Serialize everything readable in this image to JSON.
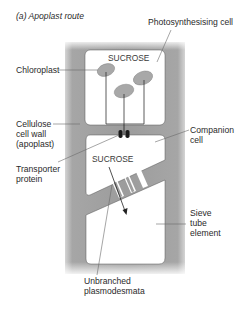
{
  "figure": {
    "title": "(a) Apoplast route",
    "colors": {
      "cell_wall": "#9a9a9a",
      "cell_wall_edge": "#c8c8c8",
      "cytoplasm": "#ffffff",
      "chloroplast": "#a8a8a8",
      "transporter": "#1a1a1a",
      "lines": "#333333"
    }
  },
  "labels": {
    "photosynthesising_cell": "Photosynthesising cell",
    "chloroplast": "Chloroplast",
    "cell_wall_line1": "Cellulose",
    "cell_wall_line2": "cell wall",
    "cell_wall_line3": "(apoplast)",
    "transporter_line1": "Transporter",
    "transporter_line2": "protein",
    "companion_line1": "Companion",
    "companion_line2": "cell",
    "sieve_line1": "Sieve",
    "sieve_line2": "tube",
    "sieve_line3": "element",
    "plasmodesmata_line1": "Unbranched",
    "plasmodesmata_line2": "plasmodesmata"
  },
  "cells": {
    "photosynthesising": {
      "content_label": "SUCROSE"
    },
    "companion": {
      "content_label": "SUCROSE"
    }
  }
}
